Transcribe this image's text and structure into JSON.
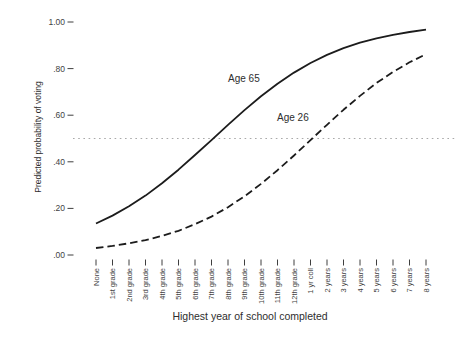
{
  "chart_data": {
    "type": "line",
    "title": "",
    "xlabel": "Highest year of school completed",
    "ylabel": "Predicted probability of voting",
    "categories": [
      "None",
      "1st grade",
      "2nd grade",
      "3rd grade",
      "4th grade",
      "5th grade",
      "6th grade",
      "7th grade",
      "8th grade",
      "9th grade",
      "10th grade",
      "11th grade",
      "12th grade",
      "1 yr coll",
      "2 years",
      "3 years",
      "4 years",
      "5 years",
      "6 years",
      "7 years",
      "8 years"
    ],
    "ylim": [
      0.0,
      1.0
    ],
    "y_ticks": [
      {
        "label": "1.00",
        "value": 1.0
      },
      {
        "label": ".80",
        "value": 0.8
      },
      {
        "label": ".60",
        "value": 0.6
      },
      {
        "label": ".40",
        "value": 0.4
      },
      {
        "label": ".20",
        "value": 0.2
      },
      {
        "label": ".00",
        "value": 0.0
      }
    ],
    "grid": false,
    "legend_position": "inline-labels",
    "reference_line": {
      "value": 0.5,
      "style": "dotted",
      "color": "#a9a9a9"
    },
    "line_color": "#1c1c1c",
    "series": [
      {
        "name": "Age 65",
        "style": "solid",
        "color": "#1c1c1c",
        "values": [
          0.135,
          0.169,
          0.209,
          0.255,
          0.308,
          0.366,
          0.429,
          0.493,
          0.559,
          0.622,
          0.681,
          0.735,
          0.783,
          0.824,
          0.859,
          0.888,
          0.911,
          0.93,
          0.945,
          0.957,
          0.967
        ]
      },
      {
        "name": "Age 26",
        "style": "dashed",
        "color": "#1c1c1c",
        "values": [
          0.03,
          0.039,
          0.05,
          0.064,
          0.082,
          0.104,
          0.132,
          0.165,
          0.205,
          0.252,
          0.305,
          0.364,
          0.427,
          0.493,
          0.559,
          0.623,
          0.683,
          0.738,
          0.786,
          0.827,
          0.862
        ]
      }
    ]
  }
}
